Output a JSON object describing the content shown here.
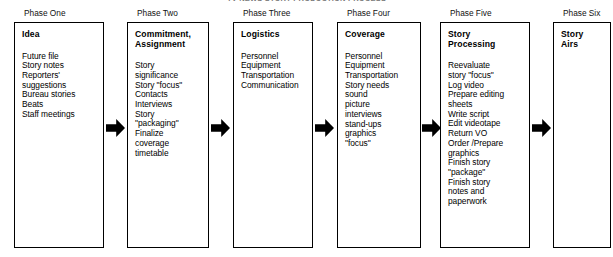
{
  "title": "TV NEWS STORY PRODUCTION PROCESS",
  "diagram": {
    "type": "process-flow",
    "direction": "left-to-right",
    "phase_count": 6,
    "arrow_count": 5,
    "colors": {
      "background": "#ffffff",
      "box_border": "#000000",
      "text": "#000000",
      "arrow": "#000000"
    },
    "phases": [
      {
        "label": "Phase One",
        "heading": "Idea",
        "items": [
          "Future file",
          "Story notes",
          "Reporters'",
          "   suggestions",
          "Bureau stories",
          "Beats",
          "Staff meetings"
        ],
        "items_text": "Future file\nStory notes\nReporters'\n   suggestions\nBureau stories\nBeats\nStaff meetings"
      },
      {
        "label": "Phase Two",
        "heading": "Commitment,\nAssignment",
        "items": [
          "Story",
          "   significance",
          "Story  \"focus\"",
          "Contacts",
          "Interviews",
          "Story",
          "   \"packaging\"",
          "Finalize",
          "   coverage",
          "   timetable"
        ],
        "items_text": "Story\n   significance\nStory  \"focus\"\nContacts\nInterviews\nStory\n   \"packaging\"\nFinalize\n   coverage\n   timetable"
      },
      {
        "label": "Phase Three",
        "heading": "Logistics",
        "items": [
          "Personnel",
          "Equipment",
          "Transportation",
          "Communication"
        ],
        "items_text": "Personnel\nEquipment\nTransportation\nCommunication"
      },
      {
        "label": "Phase Four",
        "heading": "Coverage",
        "items": [
          "Personnel",
          "Equipment",
          "Transportation",
          "Story needs",
          "   sound",
          "   picture",
          "   interviews",
          "   stand-ups",
          "   graphics",
          "   \"focus\""
        ],
        "items_text": "Personnel\nEquipment\nTransportation\nStory needs\n   sound\n   picture\n   interviews\n   stand-ups\n   graphics\n   \"focus\""
      },
      {
        "label": "Phase Five",
        "heading": "Story\nProcessing",
        "items": [
          "Reevaluate",
          "   story \"focus\"",
          "Log video",
          "Prepare editing",
          "   sheets",
          "Write script",
          "Edit videotape",
          "Return VO",
          "Order /Prepare",
          "   graphics",
          "Finish story",
          "   \"package\"",
          "Finish story",
          "   notes and",
          "   paperwork"
        ],
        "items_text": "Reevaluate\n   story \"focus\"\nLog video\nPrepare editing\n   sheets\nWrite script\nEdit videotape\nReturn VO\nOrder /Prepare\n   graphics\nFinish story\n   \"package\"\nFinish story\n   notes and\n   paperwork"
      },
      {
        "label": "Phase Six",
        "heading": "Story\nAirs",
        "items": [],
        "items_text": ""
      }
    ]
  }
}
